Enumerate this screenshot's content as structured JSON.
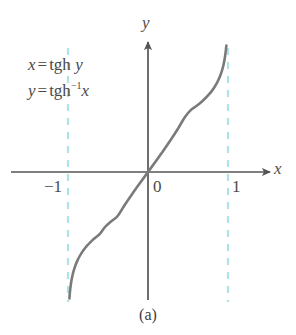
{
  "figure": {
    "caption": "(a)",
    "background_color": "#ffffff"
  },
  "annotations": {
    "equation_1": {
      "lhs": "x",
      "equals": "=",
      "fn": "tgh",
      "arg": "y"
    },
    "equation_2": {
      "lhs": "y",
      "equals": "=",
      "fn": "tgh",
      "exponent": "−1",
      "arg": "x"
    }
  },
  "axes": {
    "x_label": "x",
    "y_label": "y",
    "origin_label": "0",
    "tick_left": "−1",
    "tick_right": "1",
    "axis_color": "#555555"
  },
  "chart_data": {
    "type": "line",
    "title": "",
    "subtitle": "",
    "xlabel": "x",
    "ylabel": "y",
    "xlim": [
      -1.55,
      1.55
    ],
    "ylim": [
      -2.6,
      2.6
    ],
    "grid": false,
    "legend_position": "none",
    "curve_color": "#7a7a7a",
    "asymptote_color": "#aee3e8",
    "tick_labels": {
      "x": [
        "−1",
        "0",
        "1"
      ],
      "y": []
    },
    "annotations": [
      "x = tgh y",
      "y = tgh⁻¹x"
    ],
    "asymptotes": [
      {
        "type": "vertical",
        "x": -1,
        "style": "dashed"
      },
      {
        "type": "vertical",
        "x": 1,
        "style": "dashed"
      }
    ],
    "series": [
      {
        "name": "y = artanh(x)",
        "points": [
          [
            -0.982,
            -2.3
          ],
          [
            -0.9801,
            -2.25
          ],
          [
            -0.9757,
            -2.18
          ],
          [
            -0.9705,
            -2.11
          ],
          [
            -0.964,
            -2.04
          ],
          [
            -0.9562,
            -1.97
          ],
          [
            -0.9468,
            -1.9
          ],
          [
            -0.9354,
            -1.83
          ],
          [
            -0.9217,
            -1.76
          ],
          [
            -0.9051,
            -1.69
          ],
          [
            -0.8854,
            -1.62
          ],
          [
            -0.8617,
            -1.55
          ],
          [
            -0.8337,
            -1.48
          ],
          [
            -0.8005,
            -1.41
          ],
          [
            -0.7616,
            -1.34
          ],
          [
            -0.7163,
            -1.27
          ],
          [
            -0.664,
            -1.2
          ],
          [
            -0.6044,
            -1.13
          ],
          [
            -0.537,
            -1.0
          ],
          [
            -0.4621,
            -0.9
          ],
          [
            -0.3799,
            -0.8
          ],
          [
            -0.2913,
            -0.6
          ],
          [
            -0.1974,
            -0.4
          ],
          [
            -0.0997,
            -0.2
          ],
          [
            0.0,
            0.0
          ],
          [
            0.0997,
            0.2
          ],
          [
            0.1974,
            0.4
          ],
          [
            0.2913,
            0.6
          ],
          [
            0.3799,
            0.8
          ],
          [
            0.4621,
            1.0
          ],
          [
            0.537,
            1.13
          ],
          [
            0.6044,
            1.2
          ],
          [
            0.664,
            1.27
          ],
          [
            0.7163,
            1.34
          ],
          [
            0.7616,
            1.41
          ],
          [
            0.8005,
            1.48
          ],
          [
            0.8337,
            1.55
          ],
          [
            0.8617,
            1.62
          ],
          [
            0.8854,
            1.69
          ],
          [
            0.9051,
            1.76
          ],
          [
            0.9217,
            1.83
          ],
          [
            0.9354,
            1.9
          ],
          [
            0.9468,
            1.97
          ],
          [
            0.9562,
            2.04
          ],
          [
            0.964,
            2.11
          ],
          [
            0.9705,
            2.18
          ],
          [
            0.9757,
            2.25
          ],
          [
            0.9801,
            2.3
          ]
        ]
      }
    ]
  }
}
